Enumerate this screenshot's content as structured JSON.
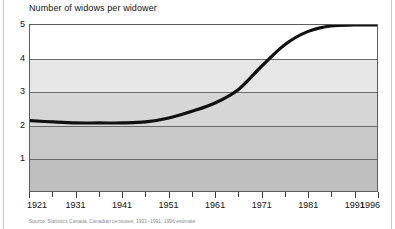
{
  "chart_data": {
    "type": "line",
    "title": "Number of widows per widower",
    "xlabel": "",
    "ylabel": "",
    "ylim": [
      0,
      5
    ],
    "xlim": [
      1921,
      1996
    ],
    "grid": true,
    "legend": false,
    "y_ticks": [
      "5",
      "4",
      "3",
      "2",
      "1"
    ],
    "y_tick_values": [
      5,
      4,
      3,
      2,
      1
    ],
    "x_tick_labels": [
      "1921",
      "1931",
      "1941",
      "1951",
      "1961",
      "1971",
      "1981",
      "1991",
      "1996"
    ],
    "x_tick_values": [
      1921,
      1931,
      1941,
      1951,
      1961,
      1971,
      1981,
      1991,
      1996
    ],
    "x_minor_ticks": [
      1926,
      1936,
      1946,
      1956,
      1966,
      1976,
      1986
    ],
    "series": [
      {
        "name": "Number of widows per widower",
        "color": "#111111",
        "x": [
          1921,
          1926,
          1931,
          1936,
          1941,
          1946,
          1951,
          1956,
          1961,
          1966,
          1971,
          1976,
          1981,
          1986,
          1991,
          1996
        ],
        "values": [
          2.12,
          2.08,
          2.05,
          2.05,
          2.05,
          2.08,
          2.2,
          2.4,
          2.65,
          3.05,
          3.75,
          4.4,
          4.8,
          4.97,
          5.0,
          5.0
        ]
      }
    ]
  },
  "figure": {
    "source_note": "Source: Statistics Canada, Canadian censuses, 1921–1991; 1996 estimate"
  }
}
